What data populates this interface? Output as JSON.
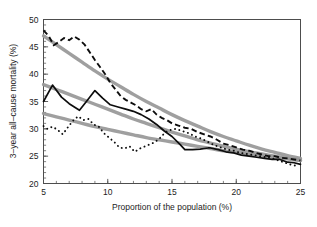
{
  "figure": {
    "background_color": "#ffffff",
    "width": 317,
    "height": 227
  },
  "axes": {
    "x_title": "Proportion of the population (%)",
    "y_title": "3–year all–cause mortality (%)",
    "x_ticks": [
      "5",
      "10",
      "15",
      "20",
      "25"
    ],
    "y_ticks": [
      "20",
      "25",
      "30",
      "35",
      "40",
      "45",
      "50"
    ],
    "frame_color": "#4d4d4d"
  },
  "colors": {
    "smooth_curve": "#9a9a9a",
    "raw_line": "#0d0d0d",
    "frame": "#4d4d4d",
    "text": "#1c1c1c"
  },
  "chart_data": {
    "type": "line",
    "title": "",
    "subtitle": "",
    "xlabel": "Proportion of the population (%)",
    "ylabel": "3–year all–cause mortality (%)",
    "xlim": [
      5,
      25
    ],
    "ylim": [
      20,
      50
    ],
    "xticks": [
      5,
      10,
      15,
      20,
      25
    ],
    "yticks": [
      20,
      25,
      30,
      35,
      40,
      45,
      50
    ],
    "x_minor_tick_step": 1,
    "y_minor_tick_step": 1,
    "grid": false,
    "legend": null,
    "legend_position": "none",
    "annotations": [],
    "series": [
      {
        "name": "Top group (observed)",
        "style": "dashed",
        "color": "#0d0d0d",
        "x": [
          5.0,
          5.4,
          5.8,
          6.2,
          6.6,
          7.0,
          7.4,
          7.8,
          8.2,
          8.6,
          9.0,
          9.4,
          9.8,
          10.2,
          10.6,
          11.0,
          11.4,
          11.8,
          12.2,
          12.6,
          13.0,
          13.4,
          13.8,
          14.2,
          14.6,
          15.0,
          15.5,
          16.0,
          16.5,
          17.0,
          17.5,
          18.0,
          18.5,
          19.0,
          19.5,
          20.0,
          20.5,
          21.0,
          21.5,
          22.0,
          22.5,
          23.0,
          23.5,
          24.0,
          24.5,
          25.0
        ],
        "y": [
          48.0,
          47.0,
          45.3,
          45.9,
          46.6,
          46.2,
          46.9,
          46.3,
          45.4,
          44.0,
          42.6,
          41.3,
          40.0,
          38.4,
          37.2,
          36.0,
          35.3,
          34.8,
          34.3,
          33.6,
          33.2,
          33.6,
          32.6,
          32.0,
          31.6,
          31.0,
          30.6,
          30.2,
          30.0,
          29.4,
          29.0,
          28.6,
          28.0,
          27.3,
          27.0,
          26.6,
          26.2,
          26.0,
          25.6,
          25.3,
          25.0,
          25.0,
          24.7,
          24.6,
          24.4,
          24.2
        ]
      },
      {
        "name": "Middle group (observed)",
        "style": "solid",
        "color": "#0d0d0d",
        "x": [
          5.0,
          5.7,
          6.4,
          7.0,
          7.8,
          8.4,
          9.0,
          9.6,
          10.2,
          10.8,
          11.4,
          12.0,
          12.6,
          13.2,
          13.8,
          14.4,
          15.0,
          15.6,
          16.0,
          16.6,
          17.2,
          17.8,
          18.0,
          18.6,
          19.2,
          19.8,
          20.4,
          21.0,
          21.6,
          22.2,
          22.8,
          23.4,
          24.0,
          24.5,
          25.0
        ],
        "y": [
          35.0,
          38.0,
          35.8,
          34.6,
          33.4,
          35.2,
          37.0,
          35.6,
          34.4,
          34.0,
          33.6,
          33.2,
          32.6,
          31.8,
          30.8,
          29.6,
          28.6,
          27.2,
          26.2,
          26.2,
          26.3,
          26.5,
          26.5,
          26.2,
          25.8,
          25.6,
          25.2,
          25.0,
          24.8,
          24.6,
          24.4,
          24.4,
          23.9,
          23.8,
          23.5
        ]
      },
      {
        "name": "Bottom group (observed)",
        "style": "dotted",
        "color": "#0d0d0d",
        "x": [
          5.0,
          5.3,
          5.7,
          6.1,
          6.5,
          6.9,
          7.3,
          7.7,
          8.1,
          8.5,
          8.9,
          9.3,
          9.7,
          10.1,
          10.5,
          10.9,
          11.3,
          11.7,
          12.1,
          12.5,
          12.9,
          13.3,
          13.7,
          14.1,
          14.5,
          14.9,
          15.3,
          15.8,
          16.3,
          16.8,
          17.3,
          17.8,
          18.3,
          18.8,
          19.3,
          19.8,
          20.3,
          20.8,
          21.3,
          21.8,
          22.3,
          22.8,
          23.3,
          23.8,
          24.3,
          24.8
        ],
        "y": [
          30.5,
          30.0,
          30.4,
          29.8,
          29.0,
          30.3,
          31.5,
          32.3,
          31.6,
          31.8,
          30.8,
          30.4,
          29.2,
          28.4,
          27.6,
          26.6,
          26.4,
          26.8,
          25.8,
          26.4,
          26.8,
          27.2,
          27.6,
          28.4,
          29.4,
          29.8,
          30.0,
          29.6,
          29.2,
          28.6,
          28.2,
          27.6,
          27.0,
          26.6,
          26.2,
          26.0,
          25.6,
          25.4,
          25.2,
          25.0,
          24.8,
          24.6,
          24.2,
          23.8,
          23.4,
          23.2
        ]
      },
      {
        "name": "Top group (smoothed)",
        "style": "smooth",
        "color": "#9a9a9a",
        "x": [
          5,
          6,
          7,
          8,
          9,
          10,
          11,
          12,
          13,
          14,
          15,
          16,
          17,
          18,
          19,
          20,
          21,
          22,
          23,
          24,
          25
        ],
        "y": [
          47.0,
          45.4,
          43.8,
          42.2,
          40.6,
          39.1,
          37.7,
          36.3,
          35.0,
          33.8,
          32.6,
          31.5,
          30.5,
          29.5,
          28.6,
          27.8,
          27.0,
          26.3,
          25.7,
          25.1,
          24.6
        ]
      },
      {
        "name": "Middle group (smoothed)",
        "style": "smooth",
        "color": "#9a9a9a",
        "x": [
          5,
          6,
          7,
          8,
          9,
          10,
          11,
          12,
          13,
          14,
          15,
          16,
          17,
          18,
          19,
          20,
          21,
          22,
          23,
          24,
          25
        ],
        "y": [
          38.1,
          37.2,
          36.3,
          35.4,
          34.5,
          33.6,
          32.7,
          31.8,
          31.0,
          30.2,
          29.4,
          28.7,
          28.0,
          27.4,
          26.8,
          26.3,
          25.8,
          25.4,
          25.0,
          24.6,
          24.3
        ]
      },
      {
        "name": "Bottom group (smoothed)",
        "style": "smooth",
        "color": "#9a9a9a",
        "x": [
          5,
          6,
          7,
          8,
          9,
          10,
          11,
          12,
          13,
          14,
          15,
          16,
          17,
          18,
          19,
          20,
          21,
          22,
          23,
          24,
          25
        ],
        "y": [
          32.8,
          32.2,
          31.6,
          31.0,
          30.4,
          29.9,
          29.4,
          28.9,
          28.4,
          28.0,
          27.6,
          27.2,
          26.8,
          26.4,
          26.0,
          25.7,
          25.4,
          25.1,
          24.8,
          24.5,
          24.2
        ]
      }
    ]
  }
}
